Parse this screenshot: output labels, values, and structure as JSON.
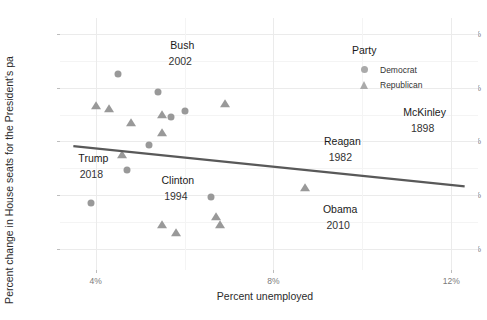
{
  "chart_data": {
    "type": "scatter",
    "title": "",
    "xlabel": "Percent unemployed",
    "ylabel": "Percent change in House seats for the President's pa",
    "xlim": [
      3.2,
      12.6
    ],
    "ylim": [
      -34,
      13
    ],
    "xticks": [
      "4%",
      "8%",
      "12%"
    ],
    "xtick_values": [
      4,
      8,
      12
    ],
    "yticks": [
      "10%",
      "0%",
      "-10%",
      "-20%",
      "-30%"
    ],
    "ytick_values": [
      10,
      0,
      -10,
      -20,
      -30
    ],
    "grid": true,
    "legend": {
      "title": "Party",
      "position": "inside-top-right",
      "entries": [
        {
          "label": "Democrat",
          "marker": "circle",
          "color": "#aaaaaa"
        },
        {
          "label": "Republican",
          "marker": "triangle",
          "color": "#aaaaaa"
        }
      ]
    },
    "series": [
      {
        "name": "Democrat",
        "marker": "circle",
        "color": "#999999",
        "points": [
          {
            "x": 4.5,
            "y": 2.5
          },
          {
            "x": 5.4,
            "y": -0.8
          },
          {
            "x": 5.7,
            "y": -5.5
          },
          {
            "x": 6.0,
            "y": -4.3
          },
          {
            "x": 5.2,
            "y": -10.6
          },
          {
            "x": 4.7,
            "y": -15.3
          },
          {
            "x": 3.9,
            "y": -21.5
          },
          {
            "x": 6.6,
            "y": -20.4
          }
        ]
      },
      {
        "name": "Republican",
        "marker": "triangle",
        "color": "#999999",
        "points": [
          {
            "x": 4.0,
            "y": -3.4
          },
          {
            "x": 4.3,
            "y": -4.0
          },
          {
            "x": 4.8,
            "y": -6.6
          },
          {
            "x": 5.5,
            "y": -5.0
          },
          {
            "x": 5.5,
            "y": -8.5
          },
          {
            "x": 6.9,
            "y": -3.0
          },
          {
            "x": 4.6,
            "y": -12.6
          },
          {
            "x": 5.5,
            "y": -25.6
          },
          {
            "x": 5.8,
            "y": -27.1
          },
          {
            "x": 6.7,
            "y": -24.2
          },
          {
            "x": 6.8,
            "y": -25.6
          },
          {
            "x": 8.7,
            "y": -18.7
          }
        ]
      }
    ],
    "fit_line": {
      "x_start": 3.5,
      "y_start": -10.9,
      "x_end": 12.3,
      "y_end": -18.4,
      "color": "#595959"
    },
    "annotations": [
      {
        "name": "Bush",
        "year": "2002",
        "x": 5.95,
        "y": 8.0
      },
      {
        "name": "McKinley",
        "year": "1898",
        "x": 11.4,
        "y": -4.6
      },
      {
        "name": "Reagan",
        "year": "1982",
        "x": 9.55,
        "y": -9.9
      },
      {
        "name": "Trump",
        "year": "2018",
        "x": 3.95,
        "y": -13.1
      },
      {
        "name": "Clinton",
        "year": "1994",
        "x": 5.85,
        "y": -17.2
      },
      {
        "name": "Obama",
        "year": "2010",
        "x": 9.5,
        "y": -22.6
      }
    ]
  }
}
